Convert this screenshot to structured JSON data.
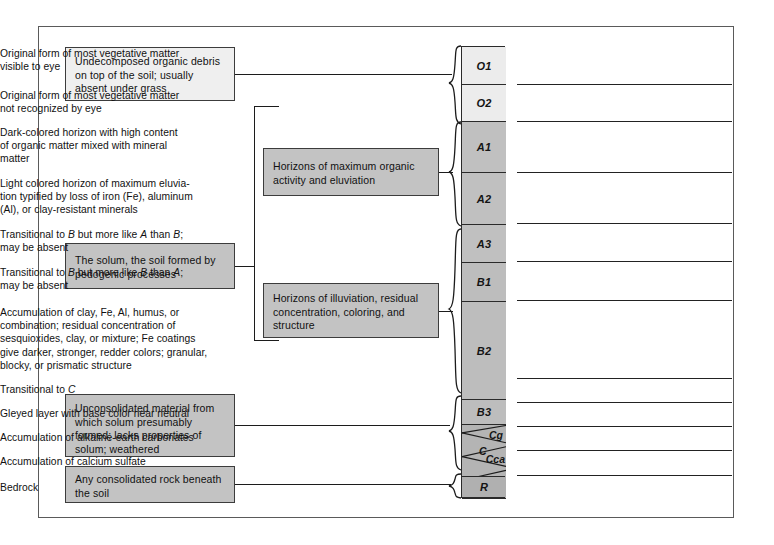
{
  "figure": {
    "frame_color": "#5a5a5a",
    "box_fill_light": "#efefef",
    "box_fill_gray": "#c3c3c3",
    "horizon_fill_o": "#ececec",
    "horizon_fill_a": "#c0c0c0",
    "horizon_fill_b": "#bdbdbd",
    "horizon_fill_c": "#b4b4b4"
  },
  "left_boxes": [
    {
      "id": "organic-debris",
      "lines": [
        "Undecomposed organic debris",
        "on top of the soil; usually",
        "absent under grass"
      ]
    },
    {
      "id": "solum",
      "lines": [
        "The solum, the soil formed by",
        "pedogenic processes"
      ]
    },
    {
      "id": "parent-material",
      "lines": [
        "Unconsolidated material from",
        "which solum presumably",
        "formed; lacks properties of",
        "solum; weathered"
      ]
    },
    {
      "id": "bedrock",
      "lines": [
        "Any consolidated rock beneath",
        "the soil"
      ]
    }
  ],
  "middle_boxes": [
    {
      "id": "a-horizons",
      "lines": [
        "Horizons of maximum organic",
        "activity and eluviation"
      ]
    },
    {
      "id": "b-horizons",
      "lines": [
        "Horizons of illuviation, residual",
        "concentration, coloring, and",
        "structure"
      ]
    }
  ],
  "horizons": [
    {
      "code": "O1",
      "group": "O"
    },
    {
      "code": "O2",
      "group": "O"
    },
    {
      "code": "A1",
      "group": "A"
    },
    {
      "code": "A2",
      "group": "A"
    },
    {
      "code": "A3",
      "group": "A"
    },
    {
      "code": "B1",
      "group": "B"
    },
    {
      "code": "B2",
      "group": "B"
    },
    {
      "code": "B3",
      "group": "B"
    },
    {
      "code": "Cg",
      "group": "C"
    },
    {
      "code": "C",
      "group": "C"
    },
    {
      "code": "Cca",
      "group": "C"
    },
    {
      "code": "Ccs",
      "group": "C"
    },
    {
      "code": "R",
      "group": "R"
    }
  ],
  "descriptions": [
    {
      "for": "O1",
      "lines": [
        "Original form of most vegetative matter",
        "visible to eye"
      ]
    },
    {
      "for": "O2",
      "lines": [
        "Original form of most vegetative matter",
        "not recognized by eye"
      ]
    },
    {
      "for": "A1",
      "lines": [
        "Dark-colored horizon with high content",
        "of organic matter mixed with mineral",
        "matter"
      ]
    },
    {
      "for": "A2",
      "lines": [
        "Light colored horizon of maximum eluvia-",
        "tion typified by loss of iron (Fe), aluminum",
        "(Al), or clay-resistant minerals"
      ]
    },
    {
      "for": "A3",
      "lines": [
        "Transitional to B but more like A than B;",
        "may be absent"
      ]
    },
    {
      "for": "B1",
      "lines": [
        "Transitional to B but more like B than A;",
        "may be absent"
      ]
    },
    {
      "for": "B2",
      "lines": [
        "Accumulation of clay, Fe, Al, humus, or",
        "combination; residual concentration of",
        "sesquioxides, clay, or mixture; Fe coatings",
        "give darker, stronger, redder colors; granular,",
        "blocky, or prismatic structure"
      ]
    },
    {
      "for": "B3",
      "lines": [
        "Transitional to C"
      ]
    },
    {
      "for": "Cg",
      "lines": [
        "Gleyed layer with base color near neutral"
      ]
    },
    {
      "for": "Cca",
      "lines": [
        "Accumulation of alkaline-earth carbonates"
      ]
    },
    {
      "for": "Ccs",
      "lines": [
        "Accumulation of calcium sulfate"
      ]
    },
    {
      "for": "R",
      "lines": [
        "Bedrock"
      ]
    }
  ]
}
